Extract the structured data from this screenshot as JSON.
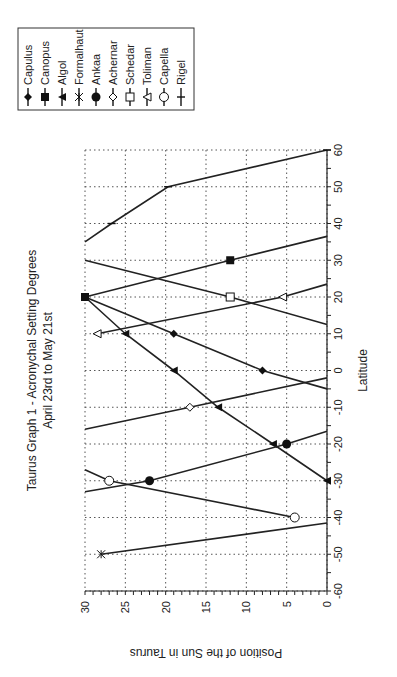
{
  "chart_data": {
    "type": "line",
    "orientation": "rotated-90",
    "title": "Taurus Graph 1  - Acronychal Setting Degrees",
    "subtitle": "April 23rd to May 21st",
    "xlabel": "Latitude",
    "ylabel": "Position of the Sun in Taurus",
    "xlim": [
      -60,
      60
    ],
    "ylim": [
      0,
      30
    ],
    "x_ticks": [
      -60,
      -50,
      -40,
      -30,
      -20,
      -10,
      0,
      10,
      20,
      30,
      40,
      50,
      60
    ],
    "y_ticks": [
      0,
      5,
      10,
      15,
      20,
      25,
      30
    ],
    "grid": true,
    "legend_position": "top-right",
    "series": [
      {
        "name": "Capulus",
        "marker": "filled-diamond",
        "points": [
          [
            20,
            30
          ],
          [
            10,
            19
          ],
          [
            0,
            8
          ],
          [
            -5,
            0
          ]
        ]
      },
      {
        "name": "Canopus",
        "marker": "filled-square",
        "points": [
          [
            20,
            30
          ],
          [
            30,
            12
          ],
          [
            36.5,
            0
          ]
        ]
      },
      {
        "name": "Algol",
        "marker": "filled-triangle",
        "points": [
          [
            20,
            30
          ],
          [
            10,
            25
          ],
          [
            0,
            19
          ],
          [
            -10,
            13.5
          ],
          [
            -20,
            6.7
          ],
          [
            -30,
            0
          ]
        ]
      },
      {
        "name": "Formalhaut",
        "marker": "asterisk",
        "points": [
          [
            -50,
            28
          ],
          [
            -41.5,
            0
          ]
        ]
      },
      {
        "name": "Ankaa",
        "marker": "filled-circle",
        "points": [
          [
            -33,
            30
          ],
          [
            -30,
            22
          ],
          [
            -20,
            5
          ],
          [
            -16.5,
            0
          ]
        ]
      },
      {
        "name": "Achernar",
        "marker": "open-diamond",
        "points": [
          [
            -16,
            30
          ],
          [
            -10,
            17
          ],
          [
            -2,
            0
          ]
        ]
      },
      {
        "name": "Schedar",
        "marker": "open-square",
        "points": [
          [
            30,
            30
          ],
          [
            20,
            12
          ],
          [
            12.5,
            0
          ]
        ]
      },
      {
        "name": "Toliman",
        "marker": "open-triangle",
        "points": [
          [
            10,
            28.5
          ],
          [
            20,
            5.5
          ],
          [
            23.5,
            0
          ]
        ]
      },
      {
        "name": "Capella",
        "marker": "open-circle",
        "points": [
          [
            -27,
            30
          ],
          [
            -30,
            27
          ],
          [
            -40,
            4
          ]
        ]
      },
      {
        "name": "Rigel",
        "marker": "tick",
        "points": [
          [
            35,
            30
          ],
          [
            40,
            26.7
          ],
          [
            50,
            19.7
          ],
          [
            60,
            0
          ]
        ]
      }
    ]
  }
}
